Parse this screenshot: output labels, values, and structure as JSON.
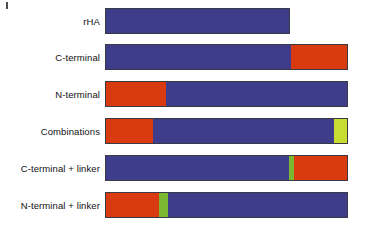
{
  "figure": {
    "type": "domain-construct-diagram",
    "background_color": "#ffffff",
    "bar_outline_color": "#3a3a44",
    "palette": {
      "blue": "#3d3d8c",
      "red": "#d93a10",
      "linker_green": "#7ab832",
      "yellow_green": "#c8dc32"
    },
    "geometry": {
      "bar_left_px": 105,
      "bar_full_right_px": 348,
      "bar_height_px": 26,
      "label_right_px": 100
    },
    "rows": [
      {
        "label": "rHA",
        "top": 8,
        "left": 105,
        "width": 185,
        "segments": [
          {
            "name": "albumin-domain",
            "color": "#3d3d8c",
            "width": 185
          }
        ]
      },
      {
        "label": "C-terminal",
        "top": 44,
        "left": 105,
        "width": 243,
        "segments": [
          {
            "name": "albumin-domain",
            "color": "#3d3d8c",
            "width": 185
          },
          {
            "name": "fusion-partner-domain",
            "color": "#d93a10",
            "width": 58
          }
        ]
      },
      {
        "label": "N-terminal",
        "top": 81,
        "left": 105,
        "width": 243,
        "segments": [
          {
            "name": "fusion-partner-domain",
            "color": "#d93a10",
            "width": 60
          },
          {
            "name": "albumin-domain",
            "color": "#3d3d8c",
            "width": 183
          }
        ]
      },
      {
        "label": "Combinations",
        "top": 118,
        "left": 105,
        "width": 243,
        "segments": [
          {
            "name": "fusion-partner-domain",
            "color": "#d93a10",
            "width": 47
          },
          {
            "name": "albumin-domain",
            "color": "#3d3d8c",
            "width": 181
          },
          {
            "name": "second-partner-domain",
            "color": "#c8dc32",
            "width": 15
          }
        ]
      },
      {
        "label": "C-terminal + linker",
        "top": 155,
        "left": 105,
        "width": 243,
        "segments": [
          {
            "name": "albumin-domain",
            "color": "#3d3d8c",
            "width": 183
          },
          {
            "name": "linker",
            "color": "#7ab832",
            "width": 5
          },
          {
            "name": "fusion-partner-domain",
            "color": "#d93a10",
            "width": 55
          }
        ]
      },
      {
        "label": "N-terminal + linker",
        "top": 192,
        "left": 105,
        "width": 243,
        "segments": [
          {
            "name": "fusion-partner-domain",
            "color": "#d93a10",
            "width": 53
          },
          {
            "name": "linker",
            "color": "#7ab832",
            "width": 9
          },
          {
            "name": "albumin-domain",
            "color": "#3d3d8c",
            "width": 181
          }
        ]
      }
    ]
  }
}
